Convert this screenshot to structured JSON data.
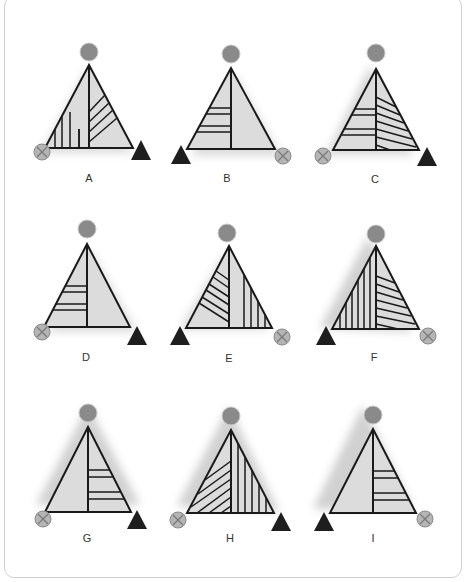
{
  "puzzle": {
    "colors": {
      "triangle_fill": "#dcdcdc",
      "line": "#1a1a1a",
      "circle": "#8a8a8a",
      "cross_circle_fill": "#b5b5b5",
      "cross_circle_mark": "#7a7a7a",
      "dark_triangle": "#1e1e1e",
      "shadow": "#9a9a9a",
      "frame_border": "#d0d0d0"
    },
    "figures": [
      {
        "label": "A",
        "left_corner": "cross-circle",
        "right_corner": "dark-triangle",
        "top": "gray-circle",
        "left_half": "vertical-lines",
        "right_half": "diagonal-lines"
      },
      {
        "label": "B",
        "left_corner": "dark-triangle",
        "right_corner": "cross-circle",
        "top": "gray-circle",
        "left_half": "horizontal-lines",
        "right_half": "plain"
      },
      {
        "label": "C",
        "left_corner": "cross-circle",
        "right_corner": "dark-triangle",
        "top": "gray-circle",
        "left_half": "horizontal-lines",
        "right_half": "diagonal-lines"
      },
      {
        "label": "D",
        "left_corner": "cross-circle",
        "right_corner": "dark-triangle",
        "top": "gray-circle",
        "left_half": "horizontal-lines",
        "right_half": "plain"
      },
      {
        "label": "E",
        "left_corner": "dark-triangle",
        "right_corner": "cross-circle",
        "top": "gray-circle",
        "left_half": "diagonal-lines",
        "right_half": "vertical-lines"
      },
      {
        "label": "F",
        "left_corner": "dark-triangle",
        "right_corner": "cross-circle",
        "top": "gray-circle",
        "left_half": "vertical-lines",
        "right_half": "diagonal-lines"
      },
      {
        "label": "G",
        "left_corner": "cross-circle",
        "right_corner": "dark-triangle",
        "top": "gray-circle",
        "left_half": "plain",
        "right_half": "horizontal-lines"
      },
      {
        "label": "H",
        "left_corner": "cross-circle",
        "right_corner": "dark-triangle",
        "top": "gray-circle",
        "left_half": "diagonal-lines",
        "right_half": "vertical-lines"
      },
      {
        "label": "I",
        "left_corner": "dark-triangle",
        "right_corner": "cross-circle",
        "top": "gray-circle",
        "left_half": "plain",
        "right_half": "horizontal-lines"
      }
    ]
  }
}
